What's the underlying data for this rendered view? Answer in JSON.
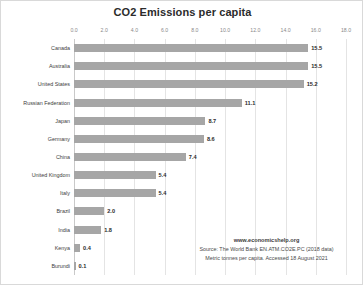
{
  "chart_data": {
    "type": "bar",
    "orientation": "horizontal",
    "title": "CO2 Emissions per capita",
    "xlabel": "",
    "ylabel": "",
    "xlim": [
      0,
      18
    ],
    "xticks": [
      "0.0",
      "2.0",
      "4.0",
      "6.0",
      "8.0",
      "10.0",
      "12.0",
      "14.0",
      "16.0",
      "18.0"
    ],
    "grid": true,
    "legend": false,
    "bar_color": "#a6a6a6",
    "gridline_color": "#e4e4e4",
    "categories": [
      "Canada",
      "Australia",
      "United States",
      "Russian Federation",
      "Japan",
      "Germany",
      "China",
      "United Kingdom",
      "Italy",
      "Brazil",
      "India",
      "Kenya",
      "Burundi"
    ],
    "values": [
      15.5,
      15.5,
      15.2,
      11.1,
      8.7,
      8.6,
      7.4,
      5.4,
      5.4,
      2.0,
      1.8,
      0.4,
      0.1
    ],
    "value_labels": [
      "15.5",
      "15.5",
      "15.2",
      "11.1",
      "8.7",
      "8.6",
      "7.4",
      "5.4",
      "5.4",
      "2.0",
      "1.8",
      "0.4",
      "0.1"
    ]
  },
  "attribution": {
    "site": "www.economicshelp.org",
    "source": "Source: The World Bank EN.ATM.CO2E.PC (2018 data)",
    "units": "Metric tonnes per capita. Accessed 18 August 2021"
  }
}
